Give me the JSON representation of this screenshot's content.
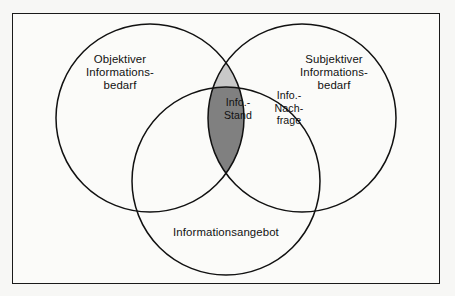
{
  "diagram": {
    "type": "venn",
    "set_count": 3,
    "background_color": "#f7f7f5",
    "frame_color": "#1a1a1a",
    "circle_stroke_color": "#111111",
    "circles": [
      {
        "id": "objektiver-informationsbedarf",
        "label": "Objektiver\nInformations-\nbedarf",
        "cx": 150,
        "cy": 118,
        "r": 94,
        "fill": "none"
      },
      {
        "id": "subjektiver-informationsbedarf",
        "label": "Subjektiver\nInformations-\nbedarf",
        "cx": 302,
        "cy": 118,
        "r": 94,
        "fill": "none"
      },
      {
        "id": "informationsangebot",
        "label": "Informationsangebot",
        "cx": 226,
        "cy": 181,
        "r": 94,
        "fill": "none"
      }
    ],
    "regions": [
      {
        "id": "info-stand",
        "label": "Info.-\nStand",
        "fill": "#808080",
        "description": "triple intersection"
      },
      {
        "id": "info-nachfrage",
        "label": "Info.-\nNach-\nfrage",
        "fill": "#c8c8c8",
        "description": "objektiver and subjektiver intersection outside angebot"
      }
    ],
    "colors": {
      "dark_gray": "#808080",
      "light_gray": "#c8c8c8",
      "outline": "#111111",
      "frame": "#1a1a1a",
      "paper": "#f7f7f5"
    }
  }
}
